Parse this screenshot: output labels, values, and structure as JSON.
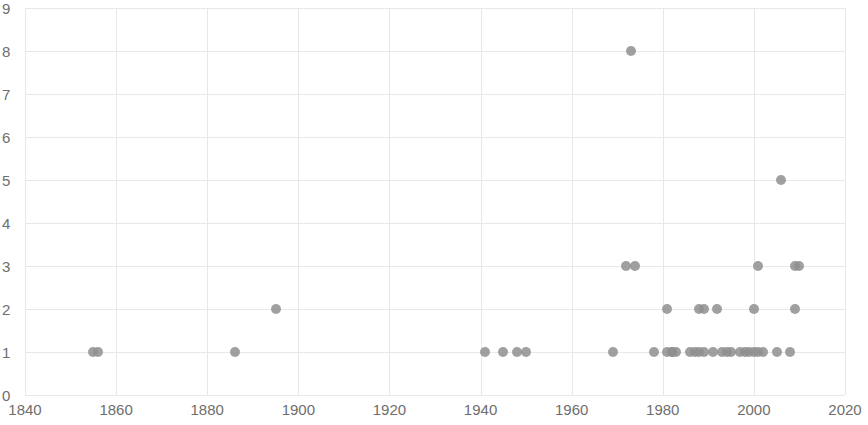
{
  "chart_data": {
    "type": "scatter",
    "title": "",
    "subtitle": "",
    "xlabel": "",
    "ylabel": "",
    "xlim": [
      1840,
      2020
    ],
    "ylim": [
      0,
      9
    ],
    "xticks": [
      1840,
      1860,
      1880,
      1900,
      1920,
      1940,
      1960,
      1980,
      2000,
      2020
    ],
    "yticks": [
      0,
      1,
      2,
      3,
      4,
      5,
      6,
      7,
      8,
      9
    ],
    "xtick_labels": [
      "1840",
      "1860",
      "1880",
      "1900",
      "1920",
      "1940",
      "1960",
      "1980",
      "2000",
      "2020"
    ],
    "ytick_labels": [
      "0",
      "1",
      "2",
      "3",
      "4",
      "5",
      "6",
      "7",
      "8",
      "9"
    ],
    "grid": true,
    "legend": null,
    "marker": {
      "shape": "circle",
      "color": "#8f8f8f",
      "size_px": 10,
      "opacity": 0.85
    },
    "series": [
      {
        "name": "series-1",
        "points": [
          {
            "x": 1855,
            "y": 1
          },
          {
            "x": 1856,
            "y": 1
          },
          {
            "x": 1886,
            "y": 1
          },
          {
            "x": 1895,
            "y": 2
          },
          {
            "x": 1941,
            "y": 1
          },
          {
            "x": 1945,
            "y": 1
          },
          {
            "x": 1948,
            "y": 1
          },
          {
            "x": 1950,
            "y": 1
          },
          {
            "x": 1973,
            "y": 8
          },
          {
            "x": 1969,
            "y": 1
          },
          {
            "x": 1972,
            "y": 3
          },
          {
            "x": 1974,
            "y": 3
          },
          {
            "x": 1978,
            "y": 1
          },
          {
            "x": 1981,
            "y": 1
          },
          {
            "x": 1982,
            "y": 1
          },
          {
            "x": 1981,
            "y": 2
          },
          {
            "x": 1982,
            "y": 1
          },
          {
            "x": 1983,
            "y": 1
          },
          {
            "x": 1986,
            "y": 1
          },
          {
            "x": 1987,
            "y": 1
          },
          {
            "x": 1988,
            "y": 1
          },
          {
            "x": 1989,
            "y": 1
          },
          {
            "x": 1988,
            "y": 2
          },
          {
            "x": 1989,
            "y": 2
          },
          {
            "x": 1991,
            "y": 1
          },
          {
            "x": 1992,
            "y": 2
          },
          {
            "x": 1993,
            "y": 1
          },
          {
            "x": 1994,
            "y": 1
          },
          {
            "x": 1995,
            "y": 1
          },
          {
            "x": 1997,
            "y": 1
          },
          {
            "x": 1998,
            "y": 1
          },
          {
            "x": 1999,
            "y": 1
          },
          {
            "x": 2000,
            "y": 1
          },
          {
            "x": 2001,
            "y": 1
          },
          {
            "x": 2002,
            "y": 1
          },
          {
            "x": 2000,
            "y": 2
          },
          {
            "x": 2001,
            "y": 3
          },
          {
            "x": 2005,
            "y": 1
          },
          {
            "x": 2006,
            "y": 5
          },
          {
            "x": 2008,
            "y": 1
          },
          {
            "x": 2009,
            "y": 2
          },
          {
            "x": 2009,
            "y": 3
          },
          {
            "x": 2010,
            "y": 3
          }
        ]
      }
    ]
  },
  "axis": {
    "x_min_label": "1840",
    "x_max_label": "2020",
    "y_min_label": "0",
    "y_max_label": "9"
  },
  "colors": {
    "marker": "#8f8f8f",
    "grid": "#e8e8e8",
    "axis": "#d0d0d0",
    "tick_text": "#6e6e6e",
    "background": "#ffffff"
  }
}
